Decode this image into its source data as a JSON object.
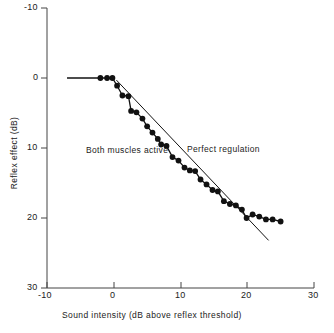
{
  "chart_data": {
    "type": "line",
    "title": "",
    "xlabel": "Sound intensity (dB above reflex threshold)",
    "ylabel": "Reflex effect (dB)",
    "xlim": [
      -10,
      30
    ],
    "ylim": [
      -10,
      30
    ],
    "y_axis_inverted": true,
    "grid": false,
    "legend_position": "inline-annotations",
    "xticks": [
      -10,
      0,
      10,
      20,
      30
    ],
    "xtick_labels": [
      "-10",
      "0",
      "10",
      "20",
      "30"
    ],
    "yticks": [
      -10,
      0,
      10,
      20,
      30
    ],
    "ytick_labels": [
      "-10",
      "0",
      "10",
      "20",
      "30"
    ],
    "series": [
      {
        "name": "Both muscles active",
        "style": "line-with-filled-circle-markers",
        "color": "#111111",
        "x": [
          -2.0,
          -1.0,
          -0.2,
          0.5,
          1.3,
          2.2,
          2.6,
          3.4,
          4.3,
          5.0,
          5.8,
          6.6,
          7.1,
          7.9,
          8.8,
          9.7,
          10.6,
          11.4,
          12.2,
          13.0,
          13.9,
          14.8,
          15.6,
          16.5,
          17.4,
          18.3,
          19.2,
          19.9,
          20.8,
          21.8,
          22.8,
          23.8,
          25.0
        ],
        "y": [
          0.0,
          0.0,
          0.0,
          1.1,
          2.5,
          2.6,
          4.7,
          4.9,
          5.8,
          6.9,
          7.8,
          8.7,
          9.5,
          9.7,
          11.3,
          11.8,
          12.8,
          13.2,
          13.3,
          14.5,
          15.2,
          16.0,
          16.2,
          17.6,
          18.0,
          18.2,
          18.8,
          20.0,
          19.5,
          19.8,
          20.2,
          20.2,
          20.5
        ],
        "baseline_segment": {
          "x": [
            -7.0,
            -2.0
          ],
          "y": [
            0.0,
            0.0
          ]
        }
      },
      {
        "name": "Perfect regulation",
        "style": "straight-line",
        "color": "#111111",
        "x": [
          0.4,
          23.2
        ],
        "y": [
          0.3,
          23.2
        ]
      }
    ],
    "annotations": [
      {
        "name": "both-muscles-active",
        "text": "Both muscles active",
        "x": 1.0,
        "y": 9.7
      },
      {
        "name": "perfect-regulation",
        "text": "Perfect regulation",
        "x": 16.0,
        "y": 9.6
      }
    ]
  },
  "axes": {
    "x_title": "Sound intensity (dB above reflex threshold)",
    "y_title": "Reflex effect (dB)",
    "x_tick_labels": [
      "-10",
      "0",
      "10",
      "20",
      "30"
    ],
    "y_tick_labels": [
      "-10",
      "0",
      "10",
      "20",
      "30"
    ]
  },
  "labels": {
    "both_muscles": "Both muscles active",
    "perfect_regulation": "Perfect regulation"
  },
  "colors": {
    "ink": "#111111",
    "axis": "#444444",
    "background": "#ffffff"
  }
}
